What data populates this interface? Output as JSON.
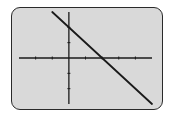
{
  "screen": {
    "type": "graphing-calculator-display",
    "background_color": "#d9d9d9",
    "border_color": "#2a2a2a",
    "ink_color": "#1a1a1a"
  },
  "chart_data": {
    "type": "line",
    "title": "",
    "xlabel": "",
    "ylabel": "",
    "xlim": [
      -3,
      5
    ],
    "ylim": [
      -3,
      3
    ],
    "xscale": 1,
    "yscale": 1,
    "x_ticks": [
      -2,
      -1,
      1,
      2,
      3,
      4
    ],
    "y_ticks": [
      -2,
      -1,
      1,
      2
    ],
    "grid": false,
    "legend": "none",
    "series": [
      {
        "name": "y = -x + 2",
        "equation": "y = -x + 2",
        "slope": -1,
        "intercept": 2,
        "x": [
          -1,
          5
        ],
        "y": [
          3,
          -3
        ]
      }
    ],
    "x_intercept": 2,
    "y_intercept": 2
  }
}
